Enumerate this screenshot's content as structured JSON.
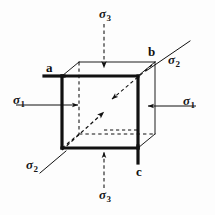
{
  "figure": {
    "background_color": "#fdfdfd",
    "line_color": "#111111",
    "labels": {
      "sigma3_top": {
        "symbol": "σ",
        "subscript": "3"
      },
      "sigma3_bottom": {
        "symbol": "σ",
        "subscript": "3"
      },
      "sigma1_left": {
        "symbol": "σ",
        "subscript": "1"
      },
      "sigma1_right": {
        "symbol": "σ",
        "subscript": "1"
      },
      "sigma2_top_right": {
        "symbol": "σ",
        "subscript": "2"
      },
      "sigma2_bottom_left": {
        "symbol": "σ",
        "subscript": "2"
      },
      "vertex_a": "a",
      "vertex_b": "b",
      "vertex_c": "c"
    },
    "geometry": {
      "front_face": {
        "left": 62,
        "top": 76,
        "right": 138,
        "bottom": 148
      },
      "depth_offset": {
        "dx": 17,
        "dy": -14
      },
      "front_edge_width_px": 3.2,
      "back_edge_width_px": 1.0,
      "hidden_line_style": "dashed"
    },
    "stress_axes": [
      {
        "name": "sigma1",
        "direction": "horizontal",
        "sense": "compression-inward"
      },
      {
        "name": "sigma2",
        "direction": "oblique-depth",
        "sense": "compression-inward"
      },
      {
        "name": "sigma3",
        "direction": "vertical",
        "sense": "compression-inward"
      }
    ]
  }
}
